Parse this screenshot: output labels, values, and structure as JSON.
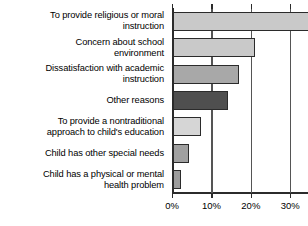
{
  "chart_data": {
    "type": "bar",
    "orientation": "horizontal",
    "title": "",
    "subtitle": "",
    "xlabel": "",
    "ylabel": "",
    "xlim": [
      0,
      34.5
    ],
    "grid": true,
    "legend": null,
    "xticks": [
      0,
      10,
      20,
      30
    ],
    "xticklabels": [
      "0%",
      "10%",
      "20%",
      "30%"
    ],
    "categories": [
      "To provide religious or moral\ninstruction",
      "Concern about school\nenvironment",
      "Dissatisfaction with academic\ninstruction",
      "Other reasons",
      "To provide a nontraditional\napproach to child's education",
      "Child has other special needs",
      "Child has a physical or mental\nhealth problem"
    ],
    "values": [
      34.5,
      20.7,
      16.8,
      13.9,
      7.0,
      4.0,
      2.0
    ],
    "bar_colors": [
      "#c9c9c9",
      "#c9c9c9",
      "#a8a8a8",
      "#4f4f4f",
      "#d6d6d6",
      "#a0a0a0",
      "#9c9c9c"
    ],
    "bar_edge_color": "#2b2b2b",
    "axis_color": "#2b2b2b",
    "grid_color": "#555555",
    "note": "Top bar is clipped at the right edge of the figure."
  }
}
